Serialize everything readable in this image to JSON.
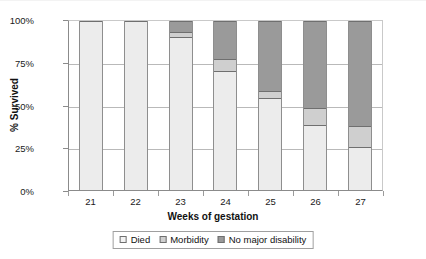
{
  "chart_data": {
    "type": "bar",
    "subtype": "stacked-100-percent",
    "title": "",
    "xlabel": "Weeks of gestation",
    "ylabel": "% Survived",
    "categories": [
      "21",
      "22",
      "23",
      "24",
      "25",
      "26",
      "27"
    ],
    "ylim": [
      0,
      100
    ],
    "ytick_labels": [
      "0%",
      "25%",
      "50%",
      "75%",
      "100%"
    ],
    "ytick_values": [
      0,
      25,
      50,
      75,
      100
    ],
    "grid": "horizontal",
    "legend_position": "bottom-center",
    "series": [
      {
        "name": "Died",
        "color": "#ececec",
        "values": [
          100,
          100,
          90,
          70,
          54,
          38,
          25
        ]
      },
      {
        "name": "Morbidity",
        "color": "#cfcfcf",
        "values": [
          0,
          0,
          3,
          7,
          4,
          10,
          12
        ]
      },
      {
        "name": "No major disability",
        "color": "#9a9a9a",
        "values": [
          0,
          0,
          7,
          23,
          42,
          52,
          63
        ]
      }
    ]
  },
  "axes": {
    "y": {
      "label": "% Survived",
      "ticks": [
        {
          "label": "100%",
          "value": 100
        },
        {
          "label": "75%",
          "value": 75
        },
        {
          "label": "50%",
          "value": 50
        },
        {
          "label": "25%",
          "value": 25
        },
        {
          "label": "0%",
          "value": 0
        }
      ]
    },
    "x": {
      "label": "Weeks of gestation",
      "ticks": [
        "21",
        "22",
        "23",
        "24",
        "25",
        "26",
        "27"
      ]
    }
  },
  "legend": {
    "items": [
      {
        "label": "Died",
        "swatch": "swatch-light-icon"
      },
      {
        "label": "Morbidity",
        "swatch": "swatch-mid-icon"
      },
      {
        "label": "No major disability",
        "swatch": "swatch-dark-icon"
      }
    ]
  }
}
